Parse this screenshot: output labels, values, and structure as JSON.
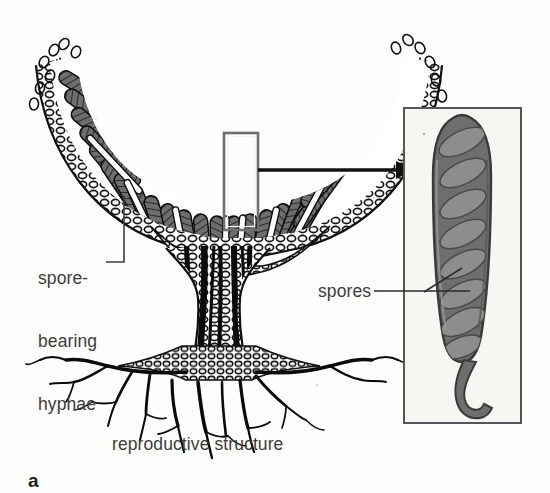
{
  "figure": {
    "panel_letter": "a",
    "caption": "reproductive structure",
    "style": "black-and-white scanned textbook line illustration with grayscale shading"
  },
  "labels": {
    "spore_bearing_hyphae": {
      "name": "spore-bearing-hyphae-label",
      "lines": [
        "spore-",
        "bearing",
        "hyphae"
      ],
      "text": "spore-bearing hyphae",
      "x": 38,
      "y": 226
    },
    "spores": {
      "name": "spores-label",
      "text": "spores",
      "x": 318,
      "y": 281
    },
    "caption": {
      "name": "figure-caption",
      "text": "reproductive structure",
      "x": 112,
      "y": 434
    },
    "panel": {
      "name": "panel-letter",
      "text": "a",
      "x": 28,
      "y": 470
    }
  },
  "callout": {
    "name": "callout-rectangle",
    "x": 224,
    "y": 133,
    "width": 34,
    "height": 97,
    "border_color": "#6e6e6e"
  },
  "arrow": {
    "name": "magnification-arrow",
    "from_x": 258,
    "to_x": 404,
    "y": 170,
    "color": "#111111"
  },
  "inset": {
    "name": "ascus-inset-panel",
    "x": 404,
    "y": 108,
    "width": 117,
    "height": 315,
    "border_color": "#55555a",
    "fill_color": "#f7f6f3",
    "content": "single ascus containing eight ascospores",
    "spore_count": 8
  },
  "colors": {
    "background": "#fdfdfb",
    "ink": "#111111",
    "text": "#3c3c3c",
    "ascus_wall": "#6b6b6b",
    "spore_fill": "#8a8a8a",
    "spore_outline": "#4f4f4f",
    "leader_line": "#4a4a4a"
  },
  "leader_lines": {
    "hyphae": {
      "name": "hyphae-leader-line",
      "path": "from label right edge at (104,262) horizontally to (124,262) then up to (124,198)"
    },
    "spores": {
      "name": "spores-leader-line",
      "path": "from label right edge at (372,291) horizontally to (455,291), with branch up-right to (444,274)"
    }
  }
}
